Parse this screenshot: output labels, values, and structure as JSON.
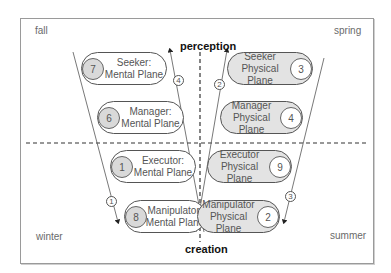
{
  "seasons": {
    "top_left": "fall",
    "top_right": "spring",
    "bottom_left": "winter",
    "bottom_right": "summer"
  },
  "axis": {
    "top": "perception",
    "bottom": "creation"
  },
  "nodes": [
    {
      "id": "seeker-mental",
      "title": "Seeker:",
      "plane": "Mental Plane",
      "number": "7",
      "side": "left",
      "style": "mental"
    },
    {
      "id": "manager-mental",
      "title": "Manager:",
      "plane": "Mental Plane",
      "number": "6",
      "side": "left",
      "style": "mental"
    },
    {
      "id": "executor-mental",
      "title": "Executor:",
      "plane": "Mental Plane",
      "number": "1",
      "side": "left",
      "style": "mental"
    },
    {
      "id": "manipulator-mental",
      "title": "Manipulator:",
      "plane": "Mental Plane",
      "number": "8",
      "side": "left",
      "style": "mental"
    },
    {
      "id": "seeker-physical",
      "title": "Seeker",
      "plane": "Physical Plane",
      "number": "3",
      "side": "right",
      "style": "physical"
    },
    {
      "id": "manager-physical",
      "title": "Manager",
      "plane": "Physical Plane",
      "number": "4",
      "side": "right",
      "style": "physical"
    },
    {
      "id": "executor-physical",
      "title": "Executor",
      "plane": "Physical Plane",
      "number": "9",
      "side": "right",
      "style": "physical"
    },
    {
      "id": "manipulator-physical",
      "title": "Manipulator",
      "plane": "Physical Plane",
      "number": "2",
      "side": "right",
      "style": "physical"
    }
  ],
  "steps": [
    {
      "label": "1",
      "path": "fall → winter (down, left side)"
    },
    {
      "label": "2",
      "path": "creation → perception (up, center-right)"
    },
    {
      "label": "3",
      "path": "spring → summer (down, right side)"
    },
    {
      "label": "4",
      "path": "creation → perception (up, center-left)"
    }
  ],
  "colors": {
    "line": "#555555",
    "physical_fill": "#e3e3e3",
    "mental_fill": "#ffffff",
    "number_gray": "#d9d9d9"
  }
}
